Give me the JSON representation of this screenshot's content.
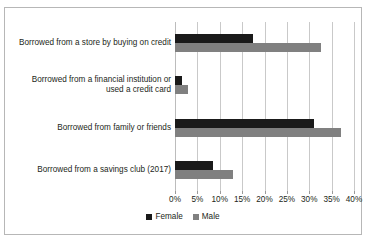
{
  "chart_data": {
    "type": "bar",
    "orientation": "horizontal",
    "title": "",
    "xlabel": "",
    "ylabel": "",
    "categories": [
      "Borrowed from a store by buying on credit",
      "Borrowed from a financial institution or used a credit card",
      "Borrowed from family or friends",
      "Borrowed from a savings club (2017)"
    ],
    "series": [
      {
        "name": "Female",
        "color": "#1a1a1a",
        "values": [
          17.5,
          1.5,
          31.0,
          8.5
        ]
      },
      {
        "name": "Male",
        "color": "#808080",
        "values": [
          32.7,
          3.0,
          37.0,
          13.0
        ]
      }
    ],
    "xlim": [
      0,
      40
    ],
    "xticks": [
      0,
      5,
      10,
      15,
      20,
      25,
      30,
      35,
      40
    ],
    "xtick_labels": [
      "0%",
      "5%",
      "10%",
      "15%",
      "20%",
      "25%",
      "30%",
      "35%",
      "40%"
    ],
    "grid": "vertical",
    "legend_position": "bottom"
  },
  "category_lines": [
    [
      "Borrowed from a store by buying on credit"
    ],
    [
      "Borrowed from a financial institution or",
      "used a credit card"
    ],
    [
      "Borrowed from family or friends"
    ],
    [
      "Borrowed from a savings club (2017)"
    ]
  ],
  "artifact": {
    "text": ""
  },
  "colors": {
    "female": "#1a1a1a",
    "male": "#808080",
    "gridline": "#c9c9c9",
    "border": "#b7b7b7",
    "text": "#231f20"
  }
}
